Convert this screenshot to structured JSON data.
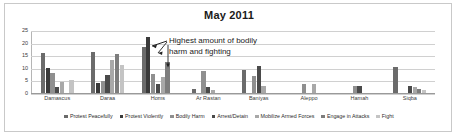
{
  "chart_data": {
    "type": "bar",
    "title": "May 2011",
    "xlabel": "",
    "ylabel": "",
    "ylim": [
      0,
      25
    ],
    "yticks": [
      0,
      5,
      10,
      15,
      20,
      25
    ],
    "grid": true,
    "legend_position": "bottom",
    "categories": [
      "Damascus",
      "Daraa",
      "Homs",
      "Ar Rastan",
      "Baniyas",
      "Aleppo",
      "Hamah",
      "Siqba"
    ],
    "series": [
      {
        "name": "Protest Peacefully",
        "color": "#6b6b6b",
        "values": [
          16,
          16.2,
          18.4,
          1.4,
          9,
          0,
          0,
          10.4
        ]
      },
      {
        "name": "Protest Violently",
        "color": "#3a3a3a",
        "values": [
          10,
          4.1,
          22.3,
          0,
          0,
          0,
          0,
          0
        ]
      },
      {
        "name": "Bodily Harm",
        "color": "#8f8f8f",
        "values": [
          8,
          4.6,
          7.5,
          8.7,
          6.9,
          3.6,
          2.8,
          0
        ]
      },
      {
        "name": "Arrest/Detain",
        "color": "#4a4a4a",
        "values": [
          2.2,
          7.2,
          3.4,
          2.4,
          10.8,
          0,
          2.8,
          2.8
        ]
      },
      {
        "name": "Mobilize Armed Forces",
        "color": "#a8a8a8",
        "values": [
          4.2,
          13.2,
          6.4,
          1.1,
          2.8,
          3.6,
          0,
          2.4
        ]
      },
      {
        "name": "Engage in Attacks",
        "color": "#7d7d7d",
        "values": [
          0,
          15.3,
          12.5,
          0,
          0,
          0,
          0,
          1.6
        ]
      },
      {
        "name": "Fight",
        "color": "#c4c4c4",
        "values": [
          5,
          11.3,
          0,
          0,
          0,
          0,
          0,
          1.2
        ]
      }
    ],
    "annotation": {
      "line1": "Highest amount of bodily",
      "line2": "harm and fighting"
    }
  }
}
